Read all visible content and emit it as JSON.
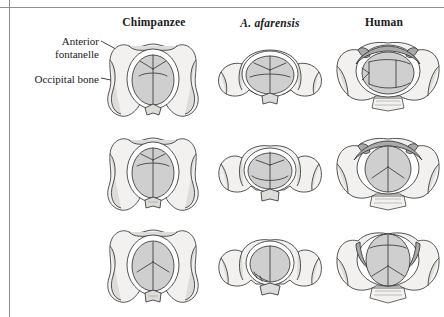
{
  "figure": {
    "type": "anatomical-comparison-illustration",
    "columns": [
      {
        "id": "chimpanzee",
        "label": "Chimpanzee",
        "italic": false
      },
      {
        "id": "a-afarensis",
        "label": "A. afarensis",
        "italic": true
      },
      {
        "id": "human",
        "label": "Human",
        "italic": false
      }
    ],
    "rows": [
      {
        "id": "row-1",
        "stage": "pelvic inlet"
      },
      {
        "id": "row-2",
        "stage": "pelvic midplane"
      },
      {
        "id": "row-3",
        "stage": "pelvic outlet"
      }
    ],
    "annotations": [
      {
        "id": "anterior-fontanelle",
        "line1": "Anterior",
        "line2": "fontanelle"
      },
      {
        "id": "occipital-bone",
        "line1": "Occipital bone",
        "line2": ""
      }
    ],
    "colors": {
      "rule": "#8d8d91",
      "outline": "#2b2b2b",
      "bone_fill": "#f2f1ef",
      "bone_shade": "#dedcd8",
      "cranium_fill": "#cfcfcf",
      "cranium_shade": "#bdbdbd",
      "pubic_arch_dark": "#a9a9a9",
      "suture": "#3a3a3a",
      "leader": "#111111"
    }
  }
}
